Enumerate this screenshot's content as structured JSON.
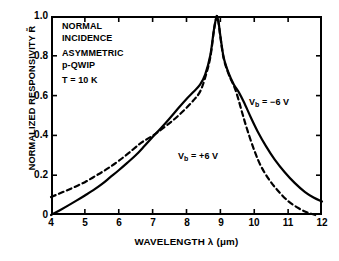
{
  "chart_data": {
    "type": "line",
    "title": "",
    "xlabel": "WAVELENGTH λ (μm)",
    "ylabel": "NORMALIZED RESPONSIVITY R̃",
    "xlim": [
      4,
      12
    ],
    "ylim": [
      0,
      1.0
    ],
    "xticks": [
      4,
      5,
      6,
      7,
      8,
      9,
      10,
      11,
      12
    ],
    "yticks": [
      0,
      0.2,
      0.4,
      0.6,
      0.8,
      1.0
    ],
    "ytick_labels": [
      "0",
      "0.2",
      "0.4",
      "0.6",
      "0.8",
      "1.0"
    ],
    "xtick_labels": [
      "4",
      "5",
      "6",
      "7",
      "8",
      "9",
      "10",
      "11",
      "12"
    ],
    "grid": false,
    "legend_position": "in-plot annotations",
    "peak": {
      "x": 8.9,
      "y": 1.0
    },
    "series": [
      {
        "name": "V_b = -6 V",
        "style": "solid",
        "color": "#000000",
        "x": [
          4.0,
          4.25,
          4.5,
          4.75,
          5.0,
          5.25,
          5.5,
          5.75,
          6.0,
          6.25,
          6.5,
          6.75,
          7.0,
          7.25,
          7.5,
          7.75,
          8.0,
          8.2,
          8.4,
          8.55,
          8.7,
          8.8,
          8.85,
          8.9,
          8.95,
          9.0,
          9.1,
          9.25,
          9.4,
          9.55,
          9.7,
          9.9,
          10.1,
          10.35,
          10.6,
          10.9,
          11.2,
          11.5,
          11.75,
          12.0
        ],
        "y": [
          0.0,
          0.023,
          0.047,
          0.072,
          0.098,
          0.125,
          0.155,
          0.19,
          0.225,
          0.262,
          0.3,
          0.345,
          0.392,
          0.437,
          0.485,
          0.535,
          0.583,
          0.618,
          0.655,
          0.705,
          0.8,
          0.92,
          0.97,
          1.0,
          0.965,
          0.9,
          0.79,
          0.71,
          0.655,
          0.615,
          0.565,
          0.49,
          0.42,
          0.345,
          0.28,
          0.215,
          0.16,
          0.115,
          0.088,
          0.068
        ]
      },
      {
        "name": "V_b = +6 V",
        "style": "dashed",
        "color": "#000000",
        "x": [
          4.0,
          4.25,
          4.5,
          4.75,
          5.0,
          5.25,
          5.5,
          5.75,
          6.0,
          6.3,
          6.6,
          6.8,
          7.0,
          7.2,
          7.45,
          7.7,
          7.95,
          8.2,
          8.4,
          8.55,
          8.7,
          8.8,
          8.85,
          8.9,
          8.95,
          9.0,
          9.1,
          9.25,
          9.4,
          9.5,
          9.65,
          9.8,
          10.0,
          10.2,
          10.45,
          10.7,
          11.0,
          11.3,
          11.55,
          11.8
        ],
        "y": [
          0.09,
          0.108,
          0.126,
          0.145,
          0.165,
          0.19,
          0.215,
          0.242,
          0.272,
          0.312,
          0.355,
          0.378,
          0.398,
          0.422,
          0.455,
          0.49,
          0.53,
          0.575,
          0.62,
          0.69,
          0.79,
          0.915,
          0.968,
          1.0,
          0.962,
          0.895,
          0.785,
          0.705,
          0.648,
          0.6,
          0.51,
          0.425,
          0.325,
          0.245,
          0.175,
          0.122,
          0.07,
          0.035,
          0.014,
          0.0
        ]
      }
    ],
    "annotations": [
      {
        "id": "condition-block",
        "lines": [
          "NORMAL",
          "INCIDENCE",
          "ASYMMETRIC",
          "p-QWIP",
          "T = 10 K"
        ]
      },
      {
        "id": "label-neg",
        "text": "V",
        "sub": "b",
        "rest": " = −6 V"
      },
      {
        "id": "label-pos",
        "text": "V",
        "sub": "b",
        "rest": " = +6 V"
      }
    ]
  },
  "annotations": {
    "condition": {
      "line1": "NORMAL",
      "line2": "INCIDENCE",
      "line3": "ASYMMETRIC",
      "line4": "p-QWIP",
      "line5": "T = 10 K"
    },
    "curve_neg": {
      "symbol": "V",
      "subscript": "b",
      "value": " = −6 V"
    },
    "curve_pos": {
      "symbol": "V",
      "subscript": "b",
      "value": " = +6 V"
    }
  },
  "axes": {
    "x_title": "WAVELENGTH λ (μm)",
    "y_title_prefix": "NORMALIZED RESPONSIVITY ",
    "y_title_symbol": "R̃"
  },
  "colors": {
    "foreground": "#000000",
    "background": "#ffffff"
  }
}
